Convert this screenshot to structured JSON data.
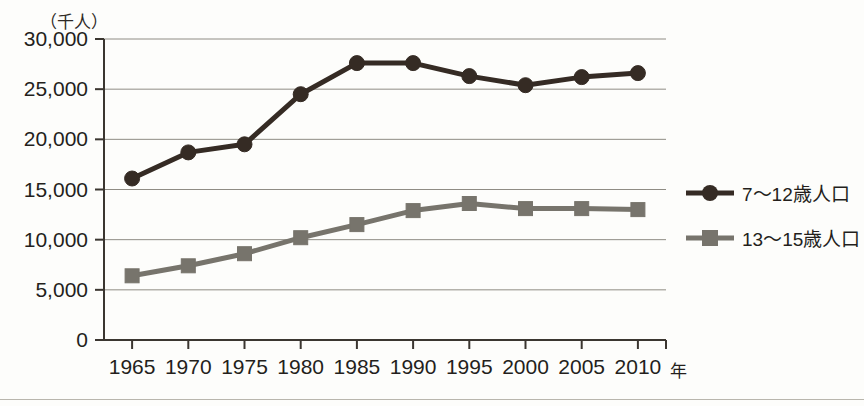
{
  "chart_data": {
    "type": "line",
    "title": "",
    "unit_label": "（千人）",
    "xlabel": "年",
    "ylabel": "",
    "x": [
      1965,
      1970,
      1975,
      1980,
      1985,
      1990,
      1995,
      2000,
      2005,
      2010
    ],
    "categories": [
      "1965",
      "1970",
      "1975",
      "1980",
      "1985",
      "1990",
      "1995",
      "2000",
      "2005",
      "2010"
    ],
    "series": [
      {
        "name": "7〜12歳人口",
        "marker": "circle",
        "color": "#352b24",
        "values": [
          16100,
          18700,
          19500,
          24500,
          27600,
          27600,
          26300,
          25400,
          26200,
          26600
        ]
      },
      {
        "name": "13〜15歳人口",
        "marker": "square",
        "color": "#77746c",
        "values": [
          6400,
          7400,
          8600,
          10200,
          11500,
          12900,
          13600,
          13100,
          13100,
          13000
        ]
      }
    ],
    "ylim": [
      0,
      30000
    ],
    "yticks": [
      0,
      5000,
      10000,
      15000,
      20000,
      25000,
      30000
    ],
    "ytick_labels": [
      "0",
      "5,000",
      "10,000",
      "15,000",
      "20,000",
      "25,000",
      "30,000"
    ],
    "xlim": [
      1962.5,
      2012.5
    ],
    "grid": "horizontal",
    "legend_position": "right"
  },
  "legend": {
    "entries": [
      {
        "label": "7〜12歳人口",
        "marker": "circle-marker",
        "color": "#352b24"
      },
      {
        "label": "13〜15歳人口",
        "marker": "square-marker",
        "color": "#77746c"
      }
    ]
  }
}
